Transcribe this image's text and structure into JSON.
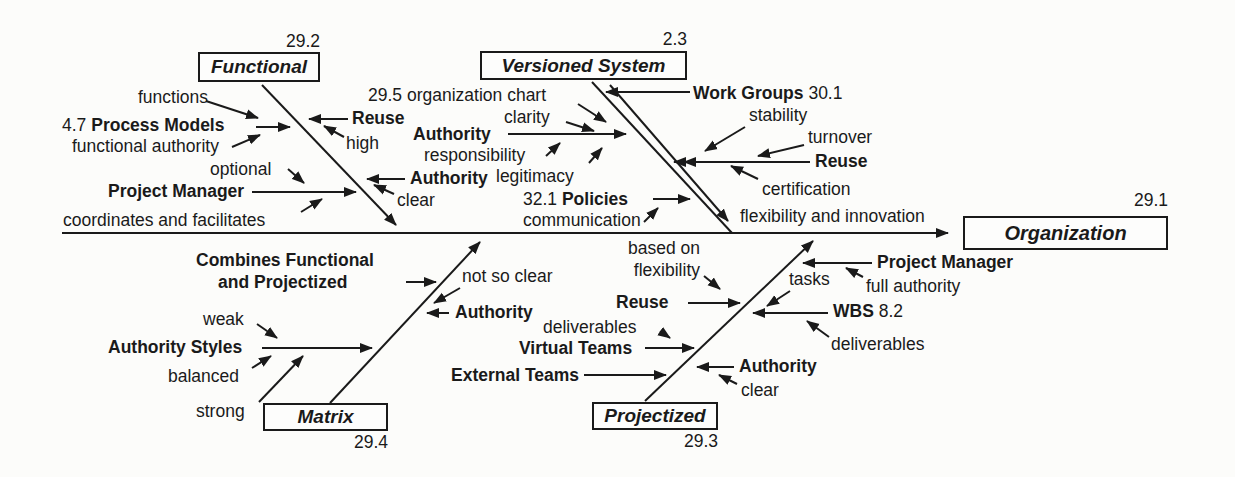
{
  "colors": {
    "ink": "#1a1a1a",
    "background": "#fcfcfa"
  },
  "head": {
    "label": "Organization",
    "number": "29.1"
  },
  "functional": {
    "label": "Functional",
    "number": "29.2",
    "functions": "functions",
    "process_models_num": "4.7",
    "process_models": "Process Models",
    "functional_authority": "functional authority",
    "reuse": "Reuse",
    "high": "high",
    "optional": "optional",
    "project_manager": "Project Manager",
    "coordinates_and_facilitates": "coordinates and facilitates",
    "authority": "Authority",
    "clear": "clear"
  },
  "versioned_system": {
    "label": "Versioned System",
    "number": "2.3",
    "organization_chart_num": "29.5",
    "organization_chart": "organization chart",
    "clarity": "clarity",
    "authority": "Authority",
    "responsibility": "responsibility",
    "legitimacy": "legitimacy",
    "policies_num": "32.1",
    "policies": "Policies",
    "communication": "communication",
    "work_groups": "Work Groups",
    "work_groups_num": "30.1",
    "stability": "stability",
    "turnover": "turnover",
    "reuse": "Reuse",
    "certification": "certification",
    "flexibility_and_innovation": "flexibility and innovation"
  },
  "matrix": {
    "label": "Matrix",
    "number": "29.4",
    "combines_line1": "Combines Functional",
    "combines_line2": "and Projectized",
    "not_so_clear": "not so clear",
    "authority": "Authority",
    "weak": "weak",
    "authority_styles": "Authority Styles",
    "balanced": "balanced",
    "strong": "strong"
  },
  "projectized": {
    "label": "Projectized",
    "number": "29.3",
    "based_on": "based on",
    "flexibility": "flexibility",
    "reuse": "Reuse",
    "deliverables_left": "deliverables",
    "virtual_teams": "Virtual Teams",
    "external_teams": "External Teams",
    "project_manager": "Project Manager",
    "full_authority": "full authority",
    "tasks": "tasks",
    "wbs": "WBS",
    "wbs_num": "8.2",
    "deliverables_right": "deliverables",
    "authority": "Authority",
    "clear": "clear"
  }
}
